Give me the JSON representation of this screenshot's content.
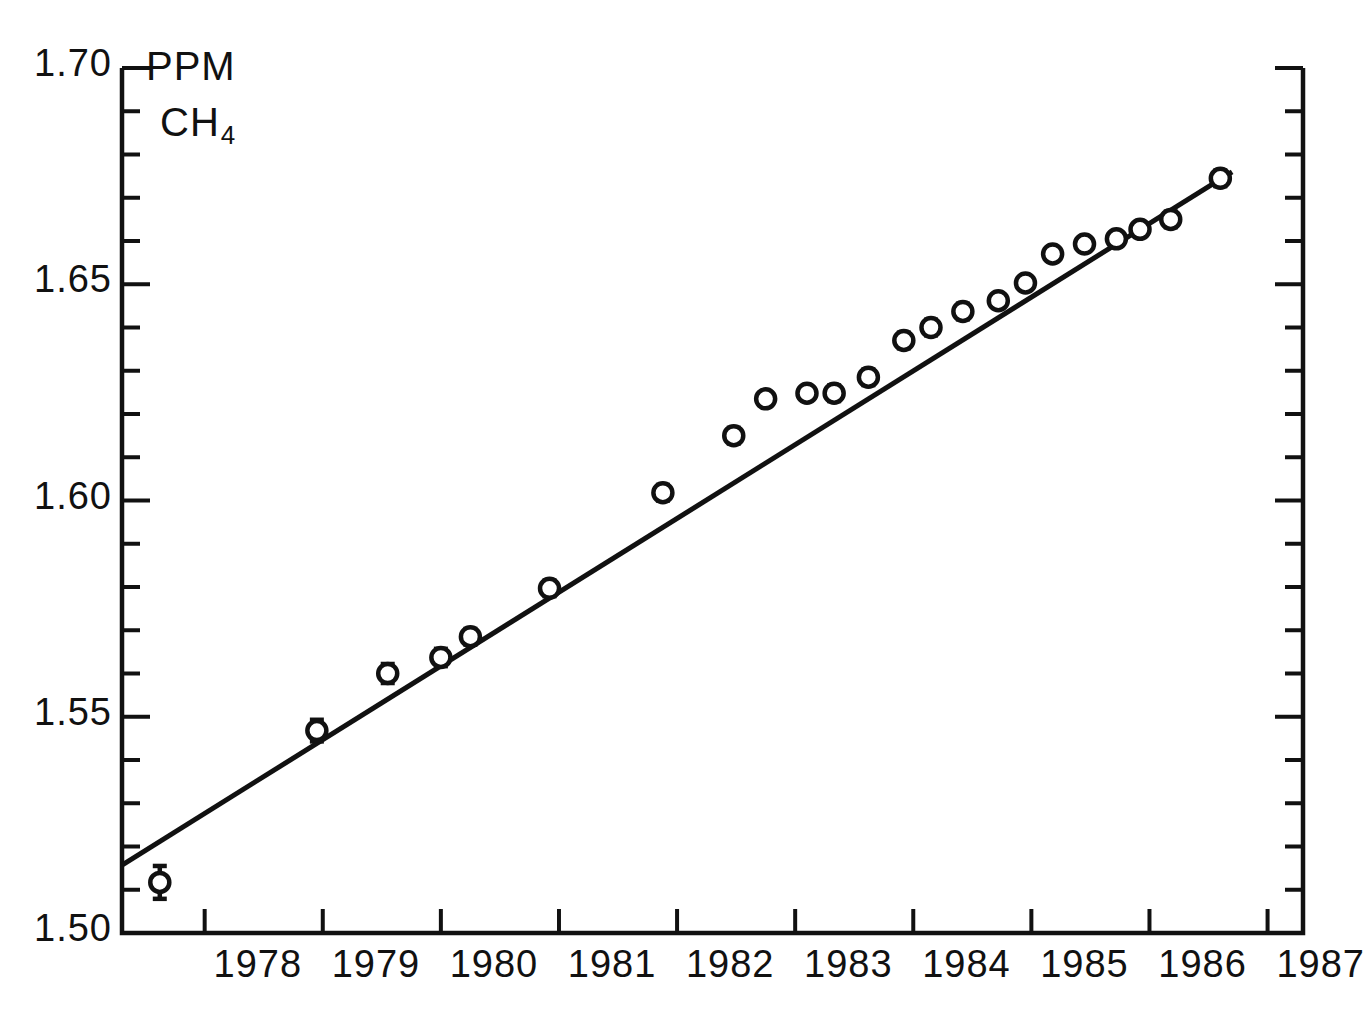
{
  "figure": {
    "unit_label": "PPM",
    "species_label": "CH",
    "species_subscript": "4",
    "ink_color": "#111111",
    "background_color": "#ffffff"
  },
  "axes": {
    "x": {
      "min": 1977.3,
      "max": 1987.3,
      "tick_labels": [
        "1978",
        "1979",
        "1980",
        "1981",
        "1982",
        "1983",
        "1984",
        "1985",
        "1986",
        "1987"
      ],
      "tick_values": [
        1978,
        1979,
        1980,
        1981,
        1982,
        1983,
        1984,
        1985,
        1986,
        1987
      ],
      "label_offset_years": 0.45,
      "tick_side": "inward"
    },
    "y": {
      "min": 1.5,
      "max": 1.7,
      "tick_labels": [
        "1.50",
        "1.55",
        "1.60",
        "1.65",
        "1.70"
      ],
      "tick_values": [
        1.5,
        1.55,
        1.6,
        1.65,
        1.7
      ],
      "minor_step": 0.01,
      "tick_side": "inward"
    }
  },
  "chart_data": {
    "type": "scatter",
    "title": "",
    "subtitle": "",
    "xlabel": "",
    "ylabel": "PPM CH4",
    "xlim": [
      1977.3,
      1987.3
    ],
    "ylim": [
      1.5,
      1.7
    ],
    "grid": false,
    "legend": "none",
    "marker": "open-circle",
    "error_bars": true,
    "series": [
      {
        "name": "CH4 global mean",
        "x": [
          1977.62,
          1978.95,
          1979.55,
          1980.0,
          1980.25,
          1980.92,
          1981.88,
          1982.48,
          1982.75,
          1983.1,
          1983.33,
          1983.62,
          1983.92,
          1984.15,
          1984.42,
          1984.72,
          1984.95,
          1985.18,
          1985.45,
          1985.72,
          1985.92,
          1986.18,
          1986.6
        ],
        "y": [
          1.5117,
          1.5468,
          1.56,
          1.5637,
          1.5685,
          1.5797,
          1.6018,
          1.615,
          1.6235,
          1.6248,
          1.6248,
          1.6285,
          1.637,
          1.64,
          1.6437,
          1.6462,
          1.6503,
          1.657,
          1.6593,
          1.6605,
          1.6627,
          1.665,
          1.6745
        ],
        "yerr": [
          0.0038,
          0.0025,
          0.0022,
          0.002,
          0.0018,
          0.0018,
          0.0018,
          0.0018,
          0.0015,
          0.0015,
          0.0018,
          0.0018,
          0.0018,
          0.0018,
          0.0018,
          0.0015,
          0.0015,
          0.0015,
          0.0015,
          0.0015,
          0.0015,
          0.0018,
          0.0018
        ]
      }
    ],
    "trend_line": {
      "name": "linear fit",
      "x": [
        1977.3,
        1986.7
      ],
      "y": [
        1.5157,
        1.676
      ]
    },
    "annotations": [
      "PPM",
      "CH4"
    ]
  }
}
